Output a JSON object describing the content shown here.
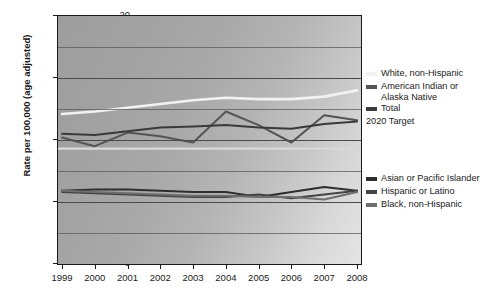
{
  "chart_data": {
    "type": "line",
    "title": "",
    "xlabel": "",
    "ylabel": "Rate per 100,000 (age adjusted)",
    "x": [
      1999,
      2000,
      2001,
      2002,
      2003,
      2004,
      2005,
      2006,
      2007,
      2008
    ],
    "xlim": [
      1999,
      2008
    ],
    "ylim": [
      0,
      20
    ],
    "yticks": [
      0,
      5,
      10,
      15,
      20
    ],
    "ytick_labels": [
      "0",
      "5",
      "10",
      "15",
      "20"
    ],
    "xtick_labels": [
      "1999",
      "2000",
      "2001",
      "2002",
      "2003",
      "2004",
      "2005",
      "2006",
      "2007",
      "2008"
    ],
    "grid": "horizontal gridlines every 2.5 units",
    "legend_position": "right",
    "series": [
      {
        "name": "White, non-Hispanic",
        "color": "#f2f2f2",
        "values": [
          12.1,
          12.3,
          12.6,
          12.9,
          13.2,
          13.4,
          13.3,
          13.3,
          13.5,
          14.0
        ]
      },
      {
        "name": "American Indian or Alaska Native",
        "color": "#555555",
        "values": [
          10.2,
          9.5,
          10.6,
          10.3,
          9.8,
          12.3,
          11.2,
          9.8,
          12.0,
          11.6
        ]
      },
      {
        "name": "Total",
        "color": "#3a3a3a",
        "values": [
          10.5,
          10.4,
          10.7,
          11.0,
          11.1,
          11.2,
          11.0,
          10.9,
          11.3,
          11.5
        ]
      },
      {
        "name": "Asian or Pacific Islander",
        "color": "#2e2e2e",
        "values": [
          5.9,
          6.0,
          6.0,
          5.9,
          5.8,
          5.8,
          5.4,
          5.8,
          6.2,
          5.9
        ]
      },
      {
        "name": "Hispanic or Latino",
        "color": "#444444",
        "values": [
          5.8,
          5.7,
          5.6,
          5.5,
          5.4,
          5.4,
          5.6,
          5.3,
          5.6,
          5.9
        ]
      },
      {
        "name": "Black, non-Hispanic",
        "color": "#6e6e6e",
        "values": [
          5.9,
          5.8,
          5.7,
          5.6,
          5.5,
          5.5,
          5.4,
          5.4,
          5.2,
          5.8
        ]
      }
    ],
    "reference_line": {
      "name": "2020 Target",
      "color": "#d9d9d9",
      "value": 9.3
    }
  },
  "legend_top": {
    "items": [
      {
        "label": "White, non-Hispanic",
        "color": "#f2f2f2"
      },
      {
        "label": "American Indian or",
        "label2": "Alaska Native",
        "color": "#555555"
      },
      {
        "label": "Total",
        "color": "#3a3a3a"
      }
    ],
    "target_label": "2020 Target",
    "target_color": "#d9d9d9"
  },
  "legend_bottom": {
    "items": [
      {
        "label": "Asian or Pacific Islander",
        "color": "#2e2e2e"
      },
      {
        "label": "Hispanic or Latino",
        "color": "#444444"
      },
      {
        "label": "Black, non-Hispanic",
        "color": "#6e6e6e"
      }
    ]
  }
}
